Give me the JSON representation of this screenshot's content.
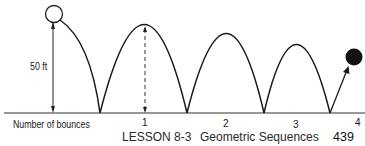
{
  "diagram": {
    "height_label": "50 ft",
    "axis_label": "Number of bounces",
    "ticks": [
      "1",
      "2",
      "3",
      "4"
    ]
  },
  "footer": {
    "lesson": "LESSON 8-3",
    "title": "Geometric Sequences",
    "page": "439"
  },
  "colors": {
    "ink": "#1a1a1a",
    "background": "#ffffff"
  }
}
